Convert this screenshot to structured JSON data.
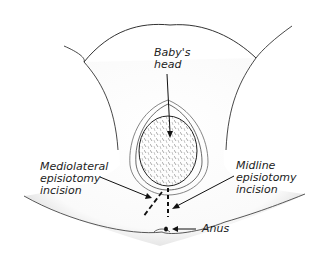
{
  "figure": {
    "labels": {
      "babys_head": "Baby's\nhead",
      "mediolateral": "Mediolateral\nepisiotomy\nincision",
      "midline": "Midline\nepisiotomy\nincision",
      "anus": "Anus"
    }
  }
}
